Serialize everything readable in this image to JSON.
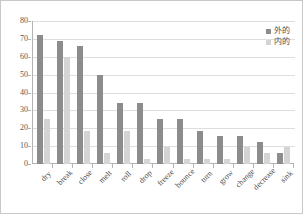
{
  "chart_data": {
    "type": "bar",
    "title": "",
    "subtitle": "",
    "xlabel": "",
    "ylabel": "",
    "ylim": [
      0,
      80
    ],
    "yticks": [
      0,
      10,
      20,
      30,
      40,
      50,
      60,
      70,
      80
    ],
    "grid": true,
    "legend_position": "top-right",
    "categories": [
      "dry",
      "break",
      "close",
      "melt",
      "roll",
      "drop",
      "freeze",
      "bounce",
      "turn",
      "grow",
      "change",
      "decrease",
      "sink"
    ],
    "series": [
      {
        "name": "外的",
        "color": "#8c8c8c",
        "values": [
          72,
          69,
          66,
          50,
          34,
          34,
          25,
          25,
          18.5,
          15.5,
          15.5,
          12.5,
          6
        ]
      },
      {
        "name": "内的",
        "color": "#d4d4d4",
        "values": [
          25,
          60,
          18.5,
          6,
          18.5,
          3,
          9.5,
          3,
          3,
          3,
          9.5,
          6,
          9.5
        ]
      }
    ]
  },
  "legend": {
    "items": [
      {
        "label": "外的",
        "swatch": "outer"
      },
      {
        "label": "内的",
        "swatch": "inner"
      }
    ]
  }
}
